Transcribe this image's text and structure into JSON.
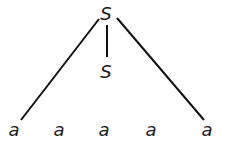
{
  "tree": {
    "root": {
      "label": "S"
    },
    "middle": {
      "label": "S"
    },
    "leaves": [
      {
        "label": "a"
      },
      {
        "label": "a"
      },
      {
        "label": "a"
      },
      {
        "label": "a"
      },
      {
        "label": "a"
      }
    ]
  }
}
